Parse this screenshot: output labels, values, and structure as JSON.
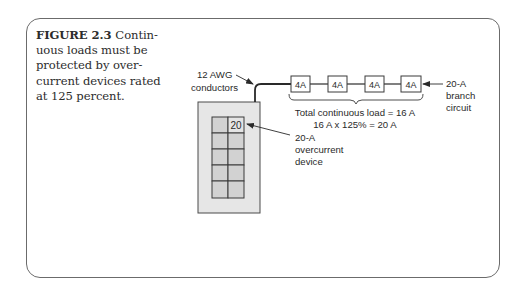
{
  "figure": {
    "number": "FIGURE 2.3",
    "caption_lines": [
      "Contin-",
      "uous loads must be",
      "protected by over-",
      "current devices rated",
      "at 125 percent."
    ]
  },
  "diagram": {
    "conductor_label": [
      "12 AWG",
      "conductors"
    ],
    "loads": [
      {
        "label": "4A"
      },
      {
        "label": "4A"
      },
      {
        "label": "4A"
      },
      {
        "label": "4A"
      }
    ],
    "branch_label": [
      "20-A",
      "branch",
      "circuit"
    ],
    "total_label": "Total continuous load = 16 A",
    "calc_label": "16 A x 125% = 20 A",
    "breaker_value": "20",
    "device_label": [
      "20-A",
      "overcurrent",
      "device"
    ],
    "colors": {
      "panel_fill": "#e6e6e6",
      "breaker_fill": "#d2d2d2",
      "stroke": "#3a3a3a",
      "frame": "#6b6b6b"
    }
  }
}
